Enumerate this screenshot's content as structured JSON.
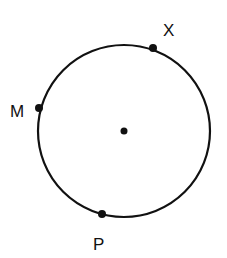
{
  "diagram": {
    "type": "circle-with-points",
    "circle": {
      "cx": 124,
      "cy": 131,
      "r": 86,
      "stroke": "#111111",
      "stroke_width": 2.2
    },
    "center_point": {
      "x": 124,
      "y": 131,
      "r": 3.5
    },
    "points": [
      {
        "id": "X",
        "label": "X",
        "x": 153,
        "y": 48,
        "label_x": 163,
        "label_y": 36
      },
      {
        "id": "M",
        "label": "M",
        "x": 39,
        "y": 108,
        "label_x": 10,
        "label_y": 117
      },
      {
        "id": "P",
        "label": "P",
        "x": 102,
        "y": 214,
        "label_x": 93,
        "label_y": 250
      }
    ]
  }
}
